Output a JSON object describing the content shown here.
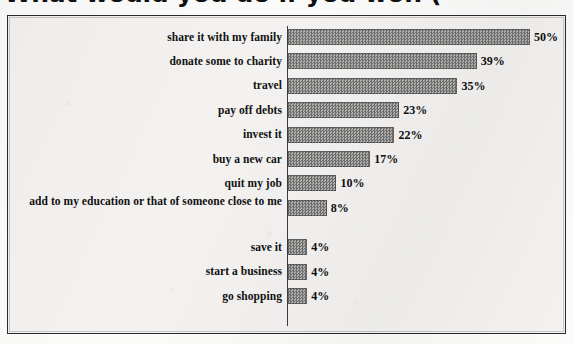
{
  "headline": {
    "text": "What would you do if you won ("
  },
  "chart_data": {
    "type": "bar",
    "orientation": "horizontal",
    "title": "What would you do if you won (",
    "xlabel": "",
    "ylabel": "",
    "xlim": [
      0,
      50
    ],
    "grid": false,
    "legend": false,
    "value_suffix": "%",
    "categories": [
      "share it with my family",
      "donate some to charity",
      "travel",
      "pay off debts",
      "invest it",
      "buy a new car",
      "quit my job",
      "add to my education or that of someone close to me",
      "save it",
      "start a business",
      "go shopping"
    ],
    "values": [
      50,
      39,
      35,
      23,
      22,
      17,
      10,
      8,
      4,
      4,
      4
    ],
    "value_labels": [
      "50%",
      "39%",
      "35%",
      "23%",
      "22%",
      "17%",
      "10%",
      "8%",
      "4%",
      "4%",
      "4%"
    ],
    "bar_color": "#8a8a8a",
    "background_color": "#f3f2f0",
    "border_color": "#2a2a2a"
  }
}
